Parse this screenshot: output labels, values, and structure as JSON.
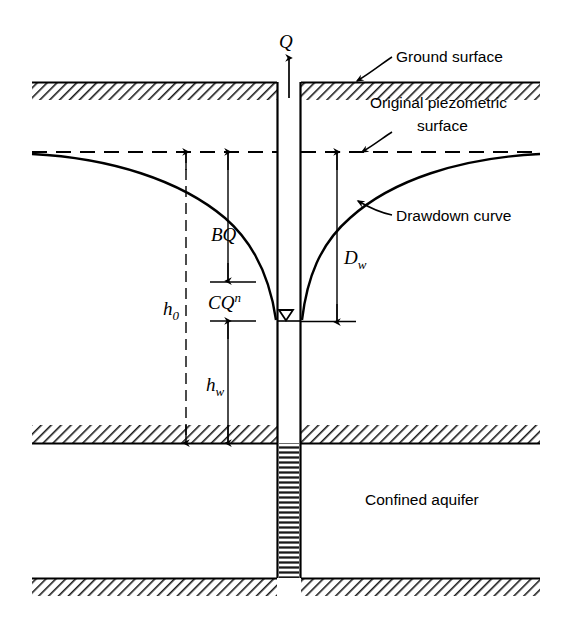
{
  "figure": {
    "title_visible": false,
    "background_color": "#ffffff",
    "line_color": "#000000"
  },
  "labels": {
    "discharge": "Q",
    "ground_surface": "Ground surface",
    "piezometric_line1": "Original piezometric",
    "piezometric_line2": "surface",
    "drawdown_curve": "Drawdown curve",
    "confined_aquifer": "Confined aquifer",
    "aquifer_loss_base": "BQ",
    "well_loss_base": "CQ",
    "well_loss_exponent": "n",
    "initial_head_base": "h",
    "initial_head_sub": "0",
    "well_head_base": "h",
    "well_head_sub": "w",
    "drawdown_base": "D",
    "drawdown_sub": "w"
  },
  "geometry": {
    "ground_surface_y": 82,
    "confining_top_y": 425,
    "confining_bottom_y": 578,
    "piezometric_y": 152,
    "well_water_level_y": 320,
    "well_left_x": 277,
    "well_right_x": 301,
    "diagram_left_x": 32,
    "diagram_right_x": 540
  },
  "dimensions": {
    "h0": {
      "x": 186,
      "top": 152,
      "bottom": 443
    },
    "BQ": {
      "x": 228,
      "top": 152,
      "bottom": 281
    },
    "CQn": {
      "top": 282,
      "bottom": 321
    },
    "hw": {
      "x": 228,
      "top": 321,
      "bottom": 443
    },
    "Dw": {
      "x": 337,
      "top": 152,
      "bottom": 322
    }
  },
  "icons": {
    "water_table_symbol": "water-table-triangle-icon",
    "flow_arrow": "upward-flow-arrow-icon"
  }
}
